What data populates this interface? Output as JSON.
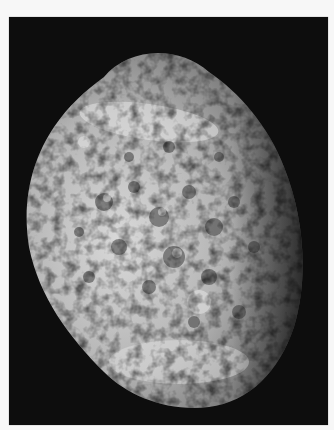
{
  "image": {
    "subject": "Irregular cratered moon (sponge-like surface) against black space",
    "colors": {
      "border": "#f7f7f7",
      "background": "#0d0d0d",
      "surface_light": "#d8d8d8",
      "surface_mid": "#9a9a9a",
      "surface_dark": "#3a3a3a"
    }
  }
}
